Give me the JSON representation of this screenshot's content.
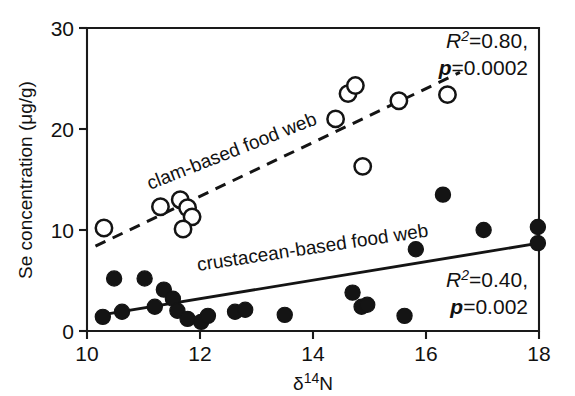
{
  "figure": {
    "background": "#ffffff",
    "ink_color": "#141414"
  },
  "chart_data": {
    "type": "scatter",
    "title": "",
    "xlabel": "δ¹⁴N",
    "ylabel": "Se concentration (μg/g)",
    "xlim": [
      10,
      18
    ],
    "ylim": [
      0,
      30
    ],
    "xticks": [
      10,
      12,
      14,
      16,
      18
    ],
    "xtick_labels": [
      "10",
      "12",
      "14",
      "16",
      "18"
    ],
    "yticks": [
      0,
      10,
      20,
      30
    ],
    "ytick_labels": [
      "0",
      "10",
      "20",
      "30"
    ],
    "grid": false,
    "legend": "inline-annotations",
    "series": [
      {
        "name": "clam-based food web",
        "marker": "open-circle",
        "label_text": "clam-based food web",
        "trendline": "dashed",
        "trend_x": [
          10.15,
          16.6
        ],
        "trend_y": [
          8.4,
          25.6
        ],
        "r_squared": "0.80",
        "p_value": "0.0002",
        "points": [
          {
            "x": 10.3,
            "y": 10.2
          },
          {
            "x": 11.3,
            "y": 12.3
          },
          {
            "x": 11.65,
            "y": 13.0
          },
          {
            "x": 11.78,
            "y": 12.2
          },
          {
            "x": 11.86,
            "y": 11.3
          },
          {
            "x": 11.7,
            "y": 10.1
          },
          {
            "x": 14.4,
            "y": 21.0
          },
          {
            "x": 14.62,
            "y": 23.5
          },
          {
            "x": 14.75,
            "y": 24.3
          },
          {
            "x": 14.88,
            "y": 16.3
          },
          {
            "x": 15.52,
            "y": 22.8
          },
          {
            "x": 16.38,
            "y": 23.4
          }
        ]
      },
      {
        "name": "crustacean-based food web",
        "marker": "filled-circle",
        "label_text": "crustacean-based food web",
        "trendline": "solid",
        "trend_x": [
          10.15,
          18.0
        ],
        "trend_y": [
          1.5,
          8.7
        ],
        "r_squared": "0.40",
        "p_value": "0.002",
        "points": [
          {
            "x": 10.28,
            "y": 1.4
          },
          {
            "x": 10.48,
            "y": 5.2
          },
          {
            "x": 10.62,
            "y": 1.9
          },
          {
            "x": 11.02,
            "y": 5.2
          },
          {
            "x": 11.2,
            "y": 2.4
          },
          {
            "x": 11.36,
            "y": 4.1
          },
          {
            "x": 11.52,
            "y": 3.2
          },
          {
            "x": 11.6,
            "y": 2.0
          },
          {
            "x": 11.78,
            "y": 1.2
          },
          {
            "x": 12.02,
            "y": 0.9
          },
          {
            "x": 12.14,
            "y": 1.5
          },
          {
            "x": 12.62,
            "y": 1.9
          },
          {
            "x": 12.8,
            "y": 2.1
          },
          {
            "x": 13.5,
            "y": 1.6
          },
          {
            "x": 14.7,
            "y": 3.8
          },
          {
            "x": 14.86,
            "y": 2.4
          },
          {
            "x": 14.96,
            "y": 2.6
          },
          {
            "x": 15.62,
            "y": 1.5
          },
          {
            "x": 15.82,
            "y": 8.1
          },
          {
            "x": 16.3,
            "y": 13.5
          },
          {
            "x": 17.02,
            "y": 10.0
          },
          {
            "x": 17.98,
            "y": 10.3
          },
          {
            "x": 17.98,
            "y": 8.7
          }
        ]
      }
    ],
    "annotations": [
      {
        "name": "clam-stats",
        "r2": "0.80",
        "p": "0.0002"
      },
      {
        "name": "crustacean-stats",
        "r2": "0.40",
        "p": "0.002"
      }
    ]
  },
  "labels": {
    "clam_label": "clam-based food web",
    "crustacean_label": "crustacean-based food web",
    "y_axis_title": "Se concentration (μg/g)",
    "x_axis_title_symbol": "δ",
    "x_axis_title_sup": "14",
    "x_axis_title_tail": "N",
    "r_symbol": "R",
    "r_sup": "2",
    "eq": "=",
    "p_symbol": "p",
    "clam_r2_value": "0.80,",
    "clam_p_value": "0.0002",
    "crust_r2_value": "0.40,",
    "crust_p_value": "0.002"
  }
}
